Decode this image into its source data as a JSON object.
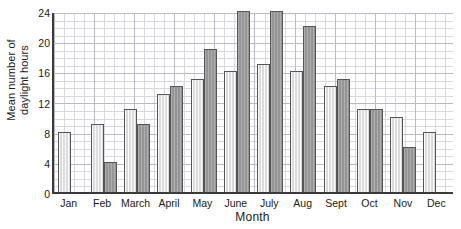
{
  "chart_data": {
    "type": "bar",
    "title": "",
    "xlabel": "Month",
    "ylabel": "Mean number of daylight hours",
    "ylabel_lines": [
      "Mean number of",
      "daylight hours"
    ],
    "categories": [
      "Jan",
      "Feb",
      "March",
      "April",
      "May",
      "June",
      "July",
      "Aug",
      "Sept",
      "Oct",
      "Nov",
      "Dec"
    ],
    "series": [
      {
        "name": "light",
        "values": [
          8,
          9,
          11,
          13,
          15,
          16,
          17,
          16,
          14,
          11,
          10,
          8
        ],
        "color": "#e3e3e3"
      },
      {
        "name": "dark",
        "values": [
          null,
          4,
          9,
          14,
          19,
          24,
          24,
          22,
          15,
          11,
          6,
          null
        ],
        "color": "#9c9c9c"
      }
    ],
    "ylim": [
      0,
      24
    ],
    "yticks": [
      0,
      4,
      8,
      12,
      16,
      20,
      24
    ],
    "ytick_labels": [
      "0",
      "4",
      "8",
      "12",
      "16",
      "20",
      "24"
    ],
    "grid": true,
    "grid_minor_step": 1,
    "grid_major_step": 4,
    "legend": "none",
    "axis_color": "#3a3a3a"
  }
}
